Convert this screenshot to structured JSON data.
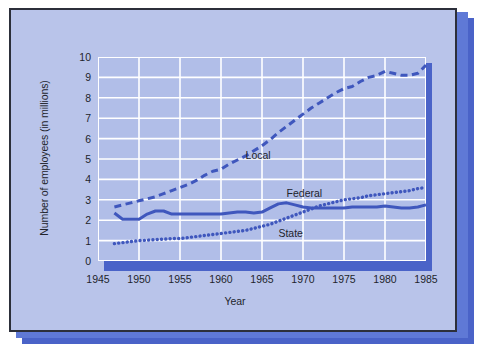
{
  "figure": {
    "background_color": "#b9c4ea",
    "plot_background_color": "#b1bee8",
    "gridline_color": "#ffffff",
    "accent_color": "#4a63c8",
    "border_color": "#2c2f3a"
  },
  "chart_data": {
    "type": "line",
    "title": "",
    "xlabel": "Year",
    "ylabel": "Number of employees (in millions)",
    "xlim": [
      1945,
      1985
    ],
    "ylim": [
      0,
      10
    ],
    "xticks": [
      1945,
      1950,
      1955,
      1960,
      1965,
      1970,
      1975,
      1980,
      1985
    ],
    "yticks": [
      0,
      1,
      2,
      3,
      4,
      5,
      6,
      7,
      8,
      9,
      10
    ],
    "grid": true,
    "legend": "inline-annotations",
    "series": [
      {
        "name": "Local",
        "style": "dashed",
        "color": "#3f57bd",
        "label_x": 1963,
        "label_y": 5.2,
        "x": [
          1947,
          1948,
          1949,
          1950,
          1951,
          1952,
          1953,
          1954,
          1955,
          1956,
          1957,
          1958,
          1959,
          1960,
          1961,
          1962,
          1963,
          1964,
          1965,
          1966,
          1967,
          1968,
          1969,
          1970,
          1971,
          1972,
          1973,
          1974,
          1975,
          1976,
          1977,
          1978,
          1979,
          1980,
          1981,
          1982,
          1983,
          1984,
          1985
        ],
        "y": [
          2.65,
          2.75,
          2.85,
          2.95,
          3.05,
          3.15,
          3.3,
          3.45,
          3.6,
          3.75,
          3.95,
          4.2,
          4.4,
          4.5,
          4.75,
          4.95,
          5.15,
          5.4,
          5.65,
          5.95,
          6.3,
          6.6,
          6.9,
          7.2,
          7.5,
          7.75,
          8.0,
          8.25,
          8.45,
          8.55,
          8.8,
          9.0,
          9.1,
          9.3,
          9.2,
          9.1,
          9.1,
          9.2,
          9.6
        ]
      },
      {
        "name": "Federal",
        "style": "solid",
        "color": "#3f57bd",
        "label_x": 1968,
        "label_y": 3.35,
        "x": [
          1947,
          1948,
          1949,
          1950,
          1951,
          1952,
          1953,
          1954,
          1955,
          1956,
          1957,
          1958,
          1959,
          1960,
          1961,
          1962,
          1963,
          1964,
          1965,
          1966,
          1967,
          1968,
          1969,
          1970,
          1971,
          1972,
          1973,
          1974,
          1975,
          1976,
          1977,
          1978,
          1979,
          1980,
          1981,
          1982,
          1983,
          1984,
          1985
        ],
        "y": [
          2.35,
          2.05,
          2.05,
          2.05,
          2.3,
          2.45,
          2.45,
          2.3,
          2.3,
          2.3,
          2.3,
          2.3,
          2.3,
          2.3,
          2.35,
          2.4,
          2.4,
          2.35,
          2.4,
          2.6,
          2.8,
          2.85,
          2.75,
          2.65,
          2.6,
          2.6,
          2.6,
          2.6,
          2.6,
          2.65,
          2.65,
          2.65,
          2.65,
          2.7,
          2.65,
          2.6,
          2.6,
          2.65,
          2.75
        ]
      },
      {
        "name": "State",
        "style": "dotted",
        "color": "#3f57bd",
        "label_x": 1967,
        "label_y": 1.35,
        "x": [
          1947,
          1948,
          1949,
          1950,
          1951,
          1952,
          1953,
          1954,
          1955,
          1956,
          1957,
          1958,
          1959,
          1960,
          1961,
          1962,
          1963,
          1964,
          1965,
          1966,
          1967,
          1968,
          1969,
          1970,
          1971,
          1972,
          1973,
          1974,
          1975,
          1976,
          1977,
          1978,
          1979,
          1980,
          1981,
          1982,
          1983,
          1984,
          1985
        ],
        "y": [
          0.85,
          0.9,
          0.95,
          1.0,
          1.02,
          1.05,
          1.07,
          1.1,
          1.1,
          1.15,
          1.2,
          1.25,
          1.3,
          1.35,
          1.4,
          1.45,
          1.5,
          1.6,
          1.7,
          1.8,
          1.95,
          2.1,
          2.25,
          2.4,
          2.55,
          2.7,
          2.8,
          2.9,
          3.0,
          3.05,
          3.1,
          3.2,
          3.25,
          3.3,
          3.35,
          3.4,
          3.45,
          3.55,
          3.6
        ]
      }
    ]
  }
}
